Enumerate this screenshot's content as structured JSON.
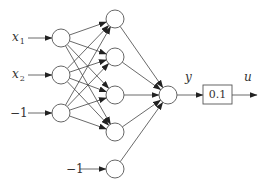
{
  "diagram": {
    "type": "neural-network",
    "colors": {
      "stroke": "#444444",
      "text": "#333333",
      "background": "#ffffff"
    },
    "inputs": [
      {
        "label": "x",
        "subscript": "1"
      },
      {
        "label": "x",
        "subscript": "2"
      },
      {
        "label": "−1",
        "subscript": ""
      }
    ],
    "hidden_bias_label": "−1",
    "output_label": "y",
    "gain_box_value": "0.1",
    "final_output_label": "u",
    "layers": {
      "input_nodes": 3,
      "hidden_nodes": 5,
      "output_nodes": 1
    }
  }
}
